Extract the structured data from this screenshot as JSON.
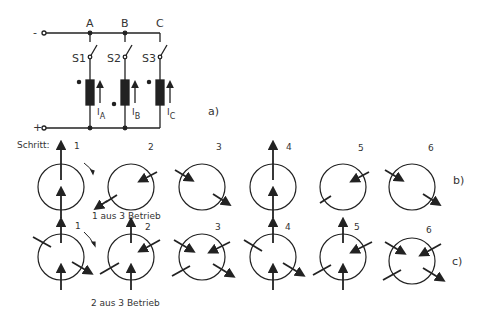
{
  "circuit": {
    "terminal_minus": "-",
    "terminal_plus": "+",
    "nodes": [
      "A",
      "B",
      "C"
    ],
    "switches": [
      "S1",
      "S2",
      "S3"
    ],
    "currents": [
      {
        "main": "I",
        "sub": "A"
      },
      {
        "main": "I",
        "sub": "B"
      },
      {
        "main": "I",
        "sub": "C"
      }
    ],
    "label": "a)"
  },
  "row_b": {
    "step_prefix": "Schritt:",
    "steps": [
      "1",
      "2",
      "3",
      "4",
      "5",
      "6"
    ],
    "caption": "1 aus 3  Betrieb",
    "label": "b)"
  },
  "row_c": {
    "steps": [
      "1",
      "2",
      "3",
      "4",
      "5",
      "6"
    ],
    "caption": "2 aus 3  Betrieb",
    "label": "c)"
  }
}
